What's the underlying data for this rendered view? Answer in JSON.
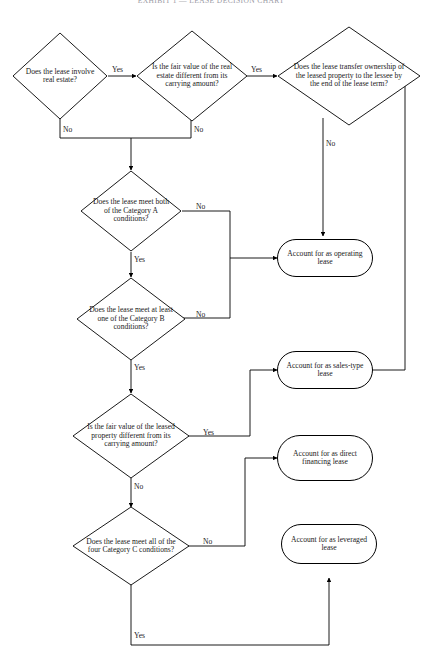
{
  "title": "EXHIBIT 1 — LEASE DECISION CHART",
  "diagram": {
    "type": "flowchart",
    "decisions": [
      {
        "id": "d1",
        "text": "Does the lease involve real estate?",
        "yes": "Yes",
        "no": "No"
      },
      {
        "id": "d2",
        "text": "Is the fair value of the real estate different from its carrying amount?",
        "yes": "Yes",
        "no": "No"
      },
      {
        "id": "d3",
        "text": "Does the lease transfer ownership of the leased property to the lessee by the end of the lease term?",
        "yes": "Yes",
        "no": "No"
      },
      {
        "id": "d4",
        "text": "Does the lease meet both of the Category A conditions?",
        "yes": "Yes",
        "no": "No"
      },
      {
        "id": "d5",
        "text": "Does the lease meet at least one of the Category B conditions?",
        "yes": "Yes",
        "no": "No"
      },
      {
        "id": "d6",
        "text": "Is the fair value of the leased property different from its carrying amount?",
        "yes": "Yes",
        "no": "No"
      },
      {
        "id": "d7",
        "text": "Does the lease meet all of the four Category C conditions?",
        "yes": "Yes",
        "no": "No"
      }
    ],
    "terminals": [
      {
        "id": "t1",
        "text": "Account for as operating lease"
      },
      {
        "id": "t2",
        "text": "Account for as sales-type lease"
      },
      {
        "id": "t3",
        "text": "Account for as direct financing lease"
      },
      {
        "id": "t4",
        "text": "Account for as leveraged lease"
      }
    ],
    "edge_labels": {
      "d1_yes": "Yes",
      "d1_no": "No",
      "d2_yes": "Yes",
      "d2_no": "No",
      "d3_yes": "Yes",
      "d3_no": "No",
      "d4_yes": "Yes",
      "d4_no": "No",
      "d5_yes": "Yes",
      "d5_no": "No",
      "d6_yes": "Yes",
      "d6_no": "No",
      "d7_yes": "Yes",
      "d7_no": "No"
    }
  },
  "colors": {
    "stroke": "#000000",
    "background": "#ffffff",
    "text": "#1a1a1a",
    "title": "#9a9aa5"
  }
}
